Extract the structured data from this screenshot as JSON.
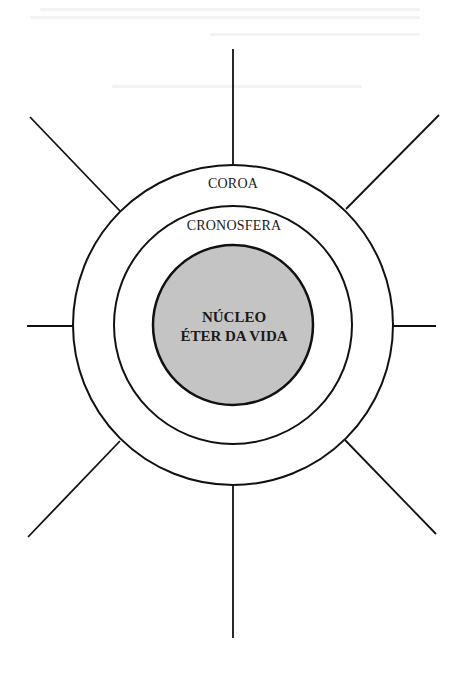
{
  "diagram": {
    "type": "concentric-circles-with-radiating-spokes",
    "center": [
      233,
      325
    ],
    "layers": [
      {
        "id": "outer",
        "label": "COROA",
        "radius": 160,
        "fill": "#ffffff"
      },
      {
        "id": "middle",
        "label": "CRONOSFERA",
        "radius": 119,
        "fill": "#ffffff"
      },
      {
        "id": "core",
        "label_line1": "NÚCLEO",
        "label_line2": "ÉTER DA VIDA",
        "radius": 80,
        "fill": "#c4c4c4"
      }
    ],
    "spokes": [
      {
        "direction": "north",
        "x1": 233,
        "y1": 49,
        "x2": 233,
        "y2": 165
      },
      {
        "direction": "south",
        "x1": 233,
        "y1": 485,
        "x2": 233,
        "y2": 638
      },
      {
        "direction": "west",
        "x1": 27,
        "y1": 326,
        "x2": 73,
        "y2": 326
      },
      {
        "direction": "east",
        "x1": 393,
        "y1": 326,
        "x2": 436,
        "y2": 326
      },
      {
        "direction": "north-west",
        "x1": 30,
        "y1": 117,
        "x2": 120,
        "y2": 211
      },
      {
        "direction": "north-east",
        "x1": 439,
        "y1": 115,
        "x2": 346,
        "y2": 209
      },
      {
        "direction": "south-west",
        "x1": 28,
        "y1": 537,
        "x2": 120,
        "y2": 441
      },
      {
        "direction": "south-east",
        "x1": 436,
        "y1": 534,
        "x2": 345,
        "y2": 440
      }
    ],
    "stroke_color": "#111111",
    "background": "#ffffff"
  },
  "labels": {
    "outer": "COROA",
    "middle": "CRONOSFERA",
    "core_line1": "NÚCLEO",
    "core_line2": "ÉTER DA VIDA"
  }
}
